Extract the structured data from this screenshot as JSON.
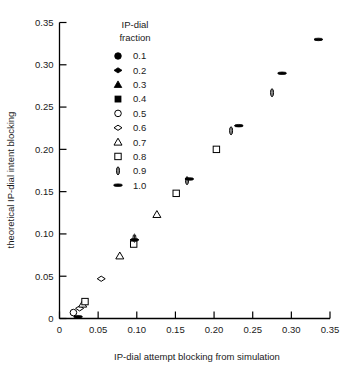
{
  "chart_data": {
    "type": "scatter",
    "title": "",
    "xlabel": "IP-dial attempt blocking from simulation",
    "ylabel": "theoretical IP-dial intent blocking",
    "xlim": [
      0,
      0.35
    ],
    "ylim": [
      0,
      0.35
    ],
    "xticks": [
      0,
      0.05,
      0.1,
      0.15,
      0.2,
      0.25,
      0.3,
      0.35
    ],
    "xtick_labels": [
      "0",
      "0.05",
      "0.10",
      "0.15",
      "0.20",
      "0.25",
      "0.30",
      "0.35"
    ],
    "yticks": [
      0,
      0.05,
      0.1,
      0.15,
      0.2,
      0.25,
      0.3,
      0.35
    ],
    "ytick_labels": [
      "0",
      "0.05",
      "0.10",
      "0.15",
      "0.20",
      "0.25",
      "0.30",
      "0.35"
    ],
    "grid": false,
    "legend_position": "top-left-inside",
    "legend_title": "IP-dial fraction",
    "series": [
      {
        "name": "0.1",
        "marker": "filled-circle",
        "points": []
      },
      {
        "name": "0.2",
        "marker": "filled-diamond",
        "points": []
      },
      {
        "name": "0.3",
        "marker": "filled-triangle",
        "points": []
      },
      {
        "name": "0.4",
        "marker": "filled-square",
        "points": []
      },
      {
        "name": "0.5",
        "marker": "open-circle",
        "points": [
          [
            0.018,
            0.007
          ]
        ]
      },
      {
        "name": "0.6",
        "marker": "open-diamond",
        "points": [
          [
            0.026,
            0.012
          ],
          [
            0.054,
            0.047
          ]
        ]
      },
      {
        "name": "0.7",
        "marker": "open-triangle",
        "points": [
          [
            0.03,
            0.017
          ],
          [
            0.078,
            0.074
          ],
          [
            0.126,
            0.123
          ]
        ]
      },
      {
        "name": "0.8",
        "marker": "open-square",
        "points": [
          [
            0.033,
            0.02
          ],
          [
            0.096,
            0.088
          ],
          [
            0.151,
            0.148
          ],
          [
            0.203,
            0.2
          ]
        ]
      },
      {
        "name": "0.9",
        "marker": "narrow-oval",
        "points": [
          [
            0.097,
            0.095
          ],
          [
            0.165,
            0.163
          ],
          [
            0.222,
            0.222
          ],
          [
            0.275,
            0.267
          ]
        ]
      },
      {
        "name": "1.0",
        "marker": "horizontal-dash",
        "points": [
          [
            0.024,
            0.002
          ],
          [
            0.097,
            0.093
          ],
          [
            0.168,
            0.165
          ],
          [
            0.232,
            0.228
          ],
          [
            0.288,
            0.29
          ],
          [
            0.335,
            0.33
          ]
        ]
      }
    ],
    "legend_entries": [
      {
        "label": "0.1",
        "marker": "filled-circle"
      },
      {
        "label": "0.2",
        "marker": "filled-diamond"
      },
      {
        "label": "0.3",
        "marker": "filled-triangle"
      },
      {
        "label": "0.4",
        "marker": "filled-square"
      },
      {
        "label": "0.5",
        "marker": "open-circle"
      },
      {
        "label": "0.6",
        "marker": "open-diamond"
      },
      {
        "label": "0.7",
        "marker": "open-triangle"
      },
      {
        "label": "0.8",
        "marker": "open-square"
      },
      {
        "label": "0.9",
        "marker": "narrow-oval"
      },
      {
        "label": "1.0",
        "marker": "horizontal-dash"
      }
    ]
  },
  "legend": {
    "title_line1": "IP-dial",
    "title_line2": "fraction"
  },
  "colors": {
    "marker": "#000000",
    "axis": "#000000",
    "background": "#ffffff",
    "text": "#1a1a1a"
  }
}
